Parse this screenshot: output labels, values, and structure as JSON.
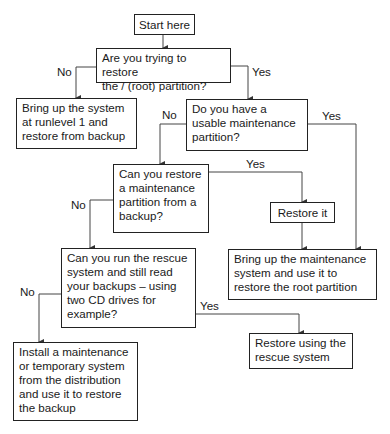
{
  "flowchart": {
    "nodes": {
      "start": "Start here",
      "q1": "Are you trying to restore\nthe / (root) partition?",
      "runlevel": "Bring up the system\nat runlevel 1 and\nrestore from backup",
      "q2": "Do you have a\nusable maintenance\npartition?",
      "q3": "Can you restore\na maintenance\npartition from a\nbackup?",
      "restore_it": "Restore it",
      "bring_maint": "Bring up the maintenance\nsystem and use it to\nrestore the root partition",
      "q4": "Can you run the rescue\nsystem and still read\nyour backups – using\ntwo CD drives for\nexample?",
      "rescue": "Restore using the\nrescue system",
      "install": "Install a maintenance\nor temporary system\nfrom the distribution\nand use it to restore\nthe backup"
    },
    "labels": {
      "q1_no": "No",
      "q1_yes": "Yes",
      "q2_no": "No",
      "q2_yes": "Yes",
      "q3_yes": "Yes",
      "q3_no": "No",
      "q4_no": "No",
      "q4_yes": "Yes"
    }
  }
}
